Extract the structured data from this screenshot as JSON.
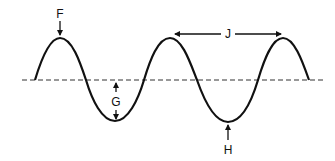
{
  "diagram": {
    "colors": {
      "wave": "#111111",
      "baseline": "#333333",
      "arrow": "#111111",
      "background": "#ffffff"
    },
    "labels": {
      "F": "F",
      "G": "G",
      "H": "H",
      "J": "J"
    },
    "label_meanings": {
      "F": "crest",
      "G": "amplitude",
      "H": "trough",
      "J": "wavelength"
    }
  }
}
